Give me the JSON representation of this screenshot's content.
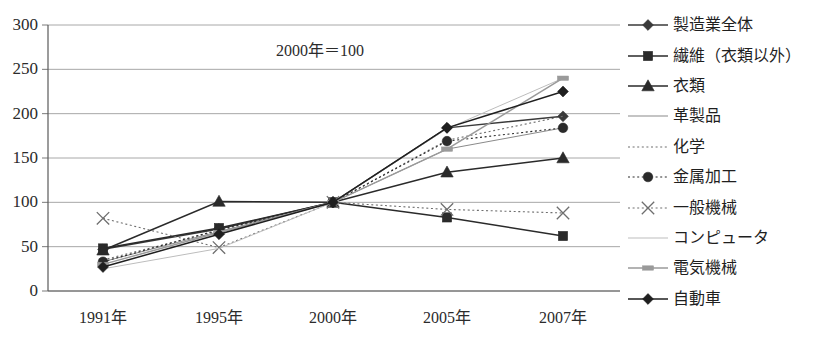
{
  "chart_data": {
    "type": "line",
    "title": "",
    "annotation": "2000年＝100",
    "xlabel": "",
    "ylabel": "",
    "categories": [
      "1991年",
      "1995年",
      "2000年",
      "2005年",
      "2007年"
    ],
    "ylim": [
      0,
      300
    ],
    "yticks": [
      0,
      50,
      100,
      150,
      200,
      250,
      300
    ],
    "ytick_labels": [
      "0",
      "50",
      "100",
      "150",
      "200",
      "250",
      "300"
    ],
    "grid": true,
    "legend_position": "right",
    "series": [
      {
        "name": "製造業全体",
        "marker": "diamond",
        "line": "solid",
        "color": "#3a3a3a",
        "values": [
          47,
          70,
          100,
          184,
          197
        ]
      },
      {
        "name": "繊維（衣類以外）",
        "marker": "square",
        "line": "solid",
        "color": "#2a2a2a",
        "values": [
          48,
          71,
          100,
          83,
          62
        ]
      },
      {
        "name": "衣類",
        "marker": "triangle",
        "line": "solid",
        "color": "#2a2a2a",
        "values": [
          46,
          101,
          100,
          134,
          150
        ]
      },
      {
        "name": "革製品",
        "marker": "none",
        "line": "solid",
        "color": "#8a8a8a",
        "values": [
          33,
          67,
          100,
          160,
          184
        ]
      },
      {
        "name": "化学",
        "marker": "none",
        "line": "dotted",
        "color": "#6e6e6e",
        "values": [
          35,
          68,
          100,
          170,
          197
        ]
      },
      {
        "name": "金属加工",
        "marker": "circle",
        "line": "dotted",
        "color": "#2a2a2a",
        "values": [
          33,
          69,
          100,
          169,
          184
        ]
      },
      {
        "name": "一般機械",
        "marker": "x",
        "line": "dotted",
        "color": "#6e6e6e",
        "values": [
          82,
          49,
          100,
          92,
          88
        ]
      },
      {
        "name": "コンピュータ",
        "marker": "none",
        "line": "solid",
        "color": "#bdbdbd",
        "values": [
          25,
          48,
          100,
          183,
          240
        ]
      },
      {
        "name": "電気機械",
        "marker": "dash",
        "line": "solid",
        "color": "#9a9a9a",
        "values": [
          30,
          66,
          100,
          160,
          240
        ]
      },
      {
        "name": "自動車",
        "marker": "diamond",
        "line": "solid",
        "color": "#1f1f1f",
        "values": [
          27,
          64,
          100,
          184,
          225
        ]
      }
    ]
  }
}
